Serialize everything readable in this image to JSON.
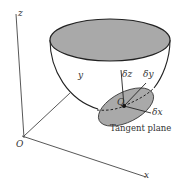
{
  "figure": {
    "labels": {
      "axis_z": "z",
      "axis_y": "y",
      "axis_x": "x",
      "origin": "O",
      "point_q": "Q",
      "delta_z": "δz",
      "delta_y": "δy",
      "delta_x": "δx",
      "tangent_plane": "Tangent plane"
    },
    "colors": {
      "fill_gray": "#a9a9a9",
      "stroke": "#2a2a2a",
      "background": "#ffffff"
    }
  }
}
